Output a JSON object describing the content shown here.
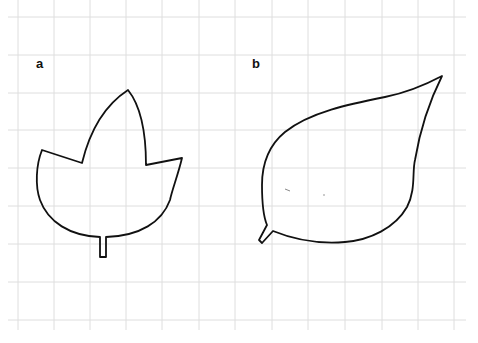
{
  "figure": {
    "panels": [
      {
        "id": "a",
        "label": "a",
        "description": "three-lobed leaf outline with short straight stalk"
      },
      {
        "id": "b",
        "label": "b",
        "description": "ovate pointed leaf outline with short angled stalk"
      }
    ],
    "grid": {
      "color": "#dedede",
      "x_lines": [
        18,
        54,
        90,
        126,
        162,
        199,
        235,
        272,
        308,
        345,
        382,
        418,
        454
      ],
      "y_lines": [
        17,
        55,
        93,
        130,
        168,
        206,
        244,
        282,
        320
      ]
    },
    "colors": {
      "background": "#ffffff",
      "outline": "#111111"
    }
  }
}
